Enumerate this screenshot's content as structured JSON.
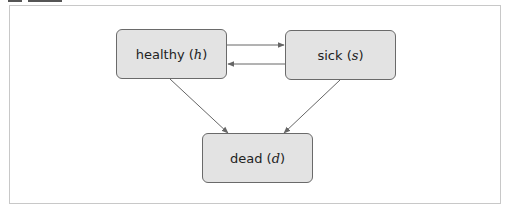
{
  "diagram": {
    "type": "state-transition",
    "nodes": [
      {
        "id": "h",
        "label": "healthy",
        "symbol": "h"
      },
      {
        "id": "s",
        "label": "sick",
        "symbol": "s"
      },
      {
        "id": "d",
        "label": "dead",
        "symbol": "d"
      }
    ],
    "edges": [
      {
        "from": "h",
        "to": "s"
      },
      {
        "from": "s",
        "to": "h"
      },
      {
        "from": "h",
        "to": "d"
      },
      {
        "from": "s",
        "to": "d"
      }
    ],
    "colors": {
      "node_fill": "#e3e3e3",
      "node_border": "#6a6a6a",
      "edge": "#666666",
      "frame": "#c8c8c8"
    }
  },
  "labels": {
    "healthy": "healthy",
    "healthy_sym": "h",
    "sick": "sick",
    "sick_sym": "s",
    "dead": "dead",
    "dead_sym": "d"
  }
}
